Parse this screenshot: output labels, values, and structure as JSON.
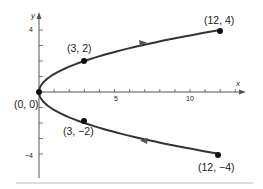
{
  "diagram": {
    "axes": {
      "x_label": "x",
      "y_label": "y",
      "x_tick_labels": [
        {
          "value": 5,
          "label": "5"
        },
        {
          "value": 10,
          "label": "10"
        }
      ],
      "y_tick_labels": [
        {
          "value": 4,
          "label": "4"
        },
        {
          "value": -4,
          "label": "−4"
        }
      ],
      "x_ticks": [
        1,
        2,
        3,
        4,
        5,
        6,
        7,
        8,
        9,
        10,
        11,
        12,
        13
      ],
      "y_ticks": [
        -4,
        -3,
        -2,
        -1,
        1,
        2,
        3,
        4
      ],
      "x_range": [
        0,
        13.5
      ],
      "y_range": [
        -5,
        5
      ]
    },
    "points": [
      {
        "x": 0,
        "y": 0,
        "label": "(0, 0)"
      },
      {
        "x": 3,
        "y": 2,
        "label": "(3, 2)"
      },
      {
        "x": 12,
        "y": 4,
        "label": "(12, 4)"
      },
      {
        "x": 3,
        "y": -2,
        "label": "(3, −2)"
      },
      {
        "x": 12,
        "y": -4,
        "label": "(12, −4)"
      }
    ],
    "arrows": [
      {
        "branch": "upper",
        "direction": "right"
      },
      {
        "branch": "lower",
        "direction": "left"
      }
    ],
    "colors": {
      "curve": "#333333",
      "axis": "#555555",
      "rule": "#bbbbbb"
    }
  }
}
